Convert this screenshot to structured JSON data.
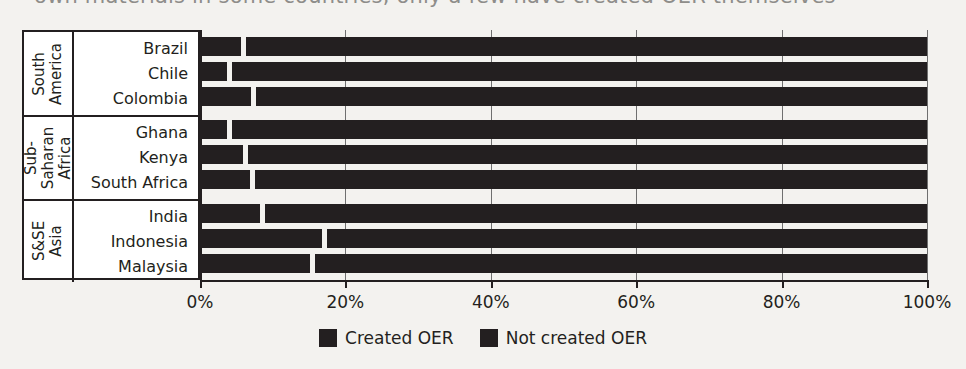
{
  "top_caption": {
    "text": "own materials in some countries, only a few have created OER themselves"
  },
  "chart_data": {
    "type": "bar",
    "orientation": "horizontal",
    "stacked": true,
    "title": "",
    "xlabel": "",
    "ylabel": "",
    "xlim": [
      0,
      100
    ],
    "xticks": [
      0,
      20,
      40,
      60,
      80,
      100
    ],
    "xtick_labels": [
      "0%",
      "20%",
      "40%",
      "60%",
      "80%",
      "100%"
    ],
    "grid": true,
    "legend_position": "bottom-center",
    "categories": [
      "Brazil",
      "Chile",
      "Colombia",
      "Ghana",
      "Kenya",
      "South Africa",
      "India",
      "Indonesia",
      "Malaysia"
    ],
    "groups": [
      {
        "label": "South America",
        "label_lines": "South\nAmerica",
        "categories": [
          "Brazil",
          "Chile",
          "Colombia"
        ]
      },
      {
        "label": "Sub-Saharan Africa",
        "label_lines": "Sub-\nSaharan\nAfrica",
        "categories": [
          "Ghana",
          "Kenya",
          "South Africa"
        ]
      },
      {
        "label": "S&SE Asia",
        "label_lines": "S&SE\nAsia",
        "categories": [
          "India",
          "Indonesia",
          "Malaysia"
        ]
      }
    ],
    "series": [
      {
        "name": "Created OER",
        "color": "#231f20",
        "values": [
          5.6,
          3.7,
          7.0,
          3.7,
          5.9,
          6.9,
          8.3,
          16.8,
          15.1
        ]
      },
      {
        "name": "Not created OER",
        "color": "#231f20",
        "values": [
          94.4,
          96.3,
          93.0,
          96.3,
          94.1,
          93.1,
          91.7,
          83.2,
          84.9
        ]
      }
    ]
  },
  "axis": {
    "ticks": [
      {
        "label": "0%",
        "value": 0
      },
      {
        "label": "20%",
        "value": 20
      },
      {
        "label": "40%",
        "value": 40
      },
      {
        "label": "60%",
        "value": 60
      },
      {
        "label": "80%",
        "value": 80
      },
      {
        "label": "100%",
        "value": 100
      }
    ]
  },
  "groups": [
    {
      "label": "South\nAmerica",
      "rows": [
        {
          "label": "Brazil",
          "created": 5.6,
          "not_created": 94.4
        },
        {
          "label": "Chile",
          "created": 3.7,
          "not_created": 96.3
        },
        {
          "label": "Colombia",
          "created": 7.0,
          "not_created": 93.0
        }
      ]
    },
    {
      "label": "Sub-\nSaharan\nAfrica",
      "rows": [
        {
          "label": "Ghana",
          "created": 3.7,
          "not_created": 96.3
        },
        {
          "label": "Kenya",
          "created": 5.9,
          "not_created": 94.1
        },
        {
          "label": "South Africa",
          "created": 6.9,
          "not_created": 93.1
        }
      ]
    },
    {
      "label": "S&SE\nAsia",
      "rows": [
        {
          "label": "India",
          "created": 8.3,
          "not_created": 91.7
        },
        {
          "label": "Indonesia",
          "created": 16.8,
          "not_created": 83.2
        },
        {
          "label": "Malaysia",
          "created": 15.1,
          "not_created": 84.9
        }
      ]
    }
  ],
  "legend": {
    "items": [
      {
        "label": "Created OER",
        "color": "#231f20"
      },
      {
        "label": "Not created OER",
        "color": "#231f20"
      }
    ]
  }
}
